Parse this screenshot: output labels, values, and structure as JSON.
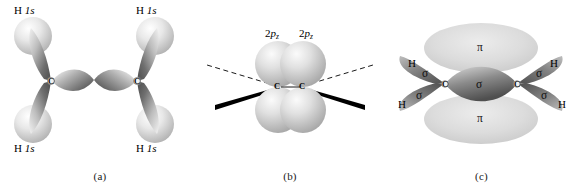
{
  "figure": {
    "molecule": "C2H4"
  },
  "panel_a": {
    "caption": "(a)",
    "description": "sp2 hybrid orbitals of two carbons overlapping with hydrogen 1s orbitals",
    "atom_labels": {
      "carbon_left": "C",
      "carbon_right": "C"
    },
    "orbital_labels": [
      {
        "id": "h-top-left",
        "element": "H",
        "orbital": "1s"
      },
      {
        "id": "h-top-right",
        "element": "H",
        "orbital": "1s"
      },
      {
        "id": "h-bottom-left",
        "element": "H",
        "orbital": "1s"
      },
      {
        "id": "h-bottom-right",
        "element": "H",
        "orbital": "1s"
      }
    ]
  },
  "panel_b": {
    "caption": "(b)",
    "description": "unhybridized 2pz orbitals on each carbon, perpendicular to the molecular plane",
    "atom_labels": {
      "carbon_left": "C",
      "carbon_right": "C"
    },
    "orbital_labels": [
      {
        "id": "p-left",
        "shell": "2",
        "type": "p",
        "sub": "z"
      },
      {
        "id": "p-right",
        "shell": "2",
        "type": "p",
        "sub": "z"
      }
    ]
  },
  "panel_c": {
    "caption": "(c)",
    "description": "resulting sigma framework and pi cloud of the carbon-carbon double bond",
    "atom_labels": {
      "carbon_left": "C",
      "carbon_right": "C"
    },
    "hydrogen_labels": [
      "H",
      "H",
      "H",
      "H"
    ],
    "bond_labels": {
      "sigma": "σ",
      "pi": "π",
      "sigma_ch": [
        "σ",
        "σ",
        "σ",
        "σ"
      ],
      "sigma_cc": "σ",
      "pi_clouds": [
        "π",
        "π"
      ]
    }
  },
  "colors": {
    "background": "#ffffff",
    "lobe_dark": "#4a4a4a",
    "lobe_mid": "#8d8d8d",
    "lobe_light": "#e4e4e4",
    "sphere_light": "#dcdcdc",
    "pi_cloud": "#d8d8d8",
    "bond_line": "#000000",
    "text": "#000000"
  }
}
